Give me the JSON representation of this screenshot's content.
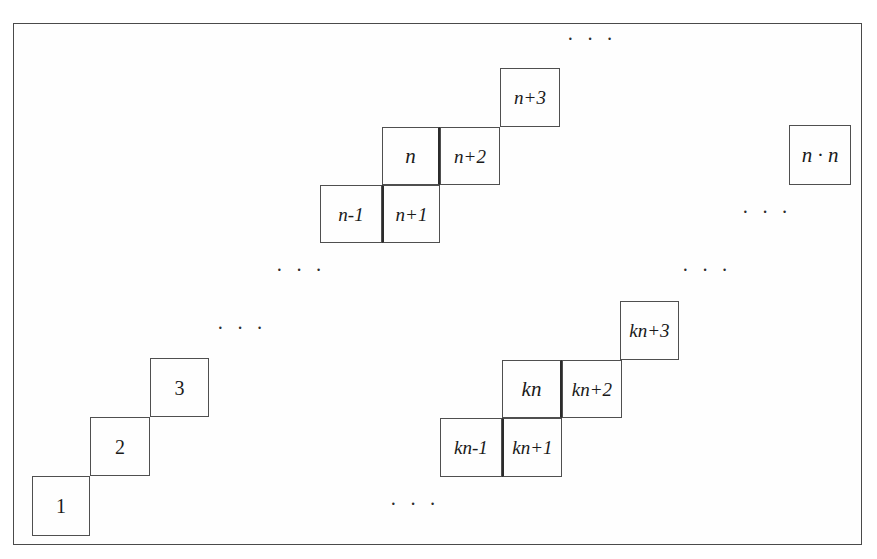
{
  "diagram": {
    "border_color": "#4a4a4a",
    "cell_border_color": "#4f4f4f",
    "thick_border_color": "#2b2b2b",
    "text_color": "#1a1a1a",
    "background": "#ffffff",
    "cells": [
      {
        "id": "n-minus-1",
        "label": "n-1",
        "x": 320,
        "y": 185,
        "w": 62,
        "h": 58,
        "size": "med",
        "italic": true,
        "thick": "none"
      },
      {
        "id": "n-plus-1",
        "label": "n+1",
        "x": 382,
        "y": 185,
        "w": 58,
        "h": 58,
        "size": "med",
        "italic": true,
        "thick": "left"
      },
      {
        "id": "n",
        "label": "n",
        "x": 382,
        "y": 127,
        "w": 58,
        "h": 58,
        "size": "big",
        "italic": true,
        "thick": "right"
      },
      {
        "id": "n-plus-2",
        "label": "n+2",
        "x": 440,
        "y": 127,
        "w": 60,
        "h": 58,
        "size": "med",
        "italic": true,
        "thick": "none"
      },
      {
        "id": "n-plus-3",
        "label": "n+3",
        "x": 500,
        "y": 68,
        "w": 60,
        "h": 59,
        "size": "med",
        "italic": true,
        "thick": "none"
      },
      {
        "id": "n-times-n",
        "label": "n · n",
        "x": 789,
        "y": 125,
        "w": 62,
        "h": 60,
        "size": "big",
        "italic": true,
        "thick": "none"
      },
      {
        "id": "one",
        "label": "1",
        "x": 32,
        "y": 476,
        "w": 58,
        "h": 60,
        "size": "num",
        "italic": false,
        "thick": "none"
      },
      {
        "id": "two",
        "label": "2",
        "x": 90,
        "y": 417,
        "w": 60,
        "h": 59,
        "size": "num",
        "italic": false,
        "thick": "none"
      },
      {
        "id": "three",
        "label": "3",
        "x": 150,
        "y": 358,
        "w": 59,
        "h": 59,
        "size": "num",
        "italic": false,
        "thick": "none"
      },
      {
        "id": "kn-minus-1",
        "label": "kn-1",
        "x": 440,
        "y": 418,
        "w": 62,
        "h": 59,
        "size": "med",
        "italic": true,
        "thick": "none"
      },
      {
        "id": "kn-plus-1",
        "label": "kn+1",
        "x": 502,
        "y": 418,
        "w": 60,
        "h": 59,
        "size": "med",
        "italic": true,
        "thick": "left"
      },
      {
        "id": "kn",
        "label": "kn",
        "x": 502,
        "y": 360,
        "w": 60,
        "h": 58,
        "size": "big",
        "italic": true,
        "thick": "right"
      },
      {
        "id": "kn-plus-2",
        "label": "kn+2",
        "x": 562,
        "y": 360,
        "w": 60,
        "h": 58,
        "size": "med",
        "italic": true,
        "thick": "none"
      },
      {
        "id": "kn-plus-3",
        "label": "kn+3",
        "x": 620,
        "y": 301,
        "w": 59,
        "h": 59,
        "size": "med",
        "italic": true,
        "thick": "none"
      }
    ],
    "ellipses": [
      {
        "id": "top-center",
        "text": "· · ·",
        "x": 567,
        "y": 29
      },
      {
        "id": "right-upper",
        "text": "· · ·",
        "x": 742,
        "y": 202
      },
      {
        "id": "middle-left",
        "text": "· · ·",
        "x": 276,
        "y": 260
      },
      {
        "id": "middle-right",
        "text": "· · ·",
        "x": 682,
        "y": 260
      },
      {
        "id": "lower-left-upper",
        "text": "· · ·",
        "x": 217,
        "y": 318
      },
      {
        "id": "bottom-center",
        "text": "· · ·",
        "x": 390,
        "y": 494
      }
    ]
  }
}
